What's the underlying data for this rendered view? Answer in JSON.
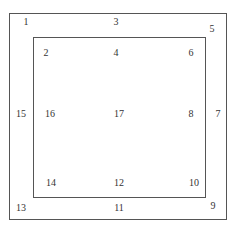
{
  "diagram": {
    "labels": [
      {
        "id": "1",
        "text": "1",
        "x": 26,
        "y": 22
      },
      {
        "id": "3",
        "text": "3",
        "x": 116,
        "y": 22
      },
      {
        "id": "5",
        "text": "5",
        "x": 212,
        "y": 29
      },
      {
        "id": "2",
        "text": "2",
        "x": 46,
        "y": 53
      },
      {
        "id": "4",
        "text": "4",
        "x": 116,
        "y": 53
      },
      {
        "id": "6",
        "text": "6",
        "x": 191,
        "y": 53
      },
      {
        "id": "15",
        "text": "15",
        "x": 21,
        "y": 114
      },
      {
        "id": "16",
        "text": "16",
        "x": 50,
        "y": 114
      },
      {
        "id": "17",
        "text": "17",
        "x": 119,
        "y": 114
      },
      {
        "id": "8",
        "text": "8",
        "x": 191,
        "y": 114
      },
      {
        "id": "7",
        "text": "7",
        "x": 218,
        "y": 114
      },
      {
        "id": "14",
        "text": "14",
        "x": 51,
        "y": 183
      },
      {
        "id": "12",
        "text": "12",
        "x": 119,
        "y": 183
      },
      {
        "id": "10",
        "text": "10",
        "x": 194,
        "y": 183
      },
      {
        "id": "13",
        "text": "13",
        "x": 21,
        "y": 208
      },
      {
        "id": "11",
        "text": "11",
        "x": 119,
        "y": 208
      },
      {
        "id": "9",
        "text": "9",
        "x": 213,
        "y": 206
      }
    ]
  }
}
